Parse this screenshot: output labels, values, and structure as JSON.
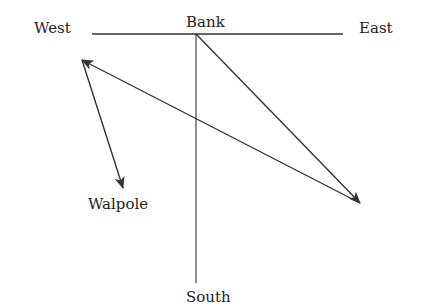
{
  "diagram": {
    "labels": {
      "west": "West",
      "bank": "Bank",
      "east": "East",
      "walpole": "Walpole",
      "south": "South"
    },
    "lines": [
      {
        "name": "west-east-axis",
        "x1": 92,
        "y1": 34,
        "x2": 343,
        "y2": 34,
        "arrow": false
      },
      {
        "name": "bank-south-axis",
        "x1": 196,
        "y1": 34,
        "x2": 196,
        "y2": 283,
        "arrow": false
      }
    ],
    "arrows": [
      {
        "name": "bank-to-southeast-arrow",
        "x1": 196,
        "y1": 34,
        "x2": 360,
        "y2": 203
      },
      {
        "name": "southeast-to-west-arrow",
        "x1": 360,
        "y1": 203,
        "x2": 82,
        "y2": 60
      },
      {
        "name": "west-to-walpole-arrow",
        "x1": 82,
        "y1": 60,
        "x2": 123,
        "y2": 188
      }
    ],
    "stroke_color": "#333333"
  }
}
